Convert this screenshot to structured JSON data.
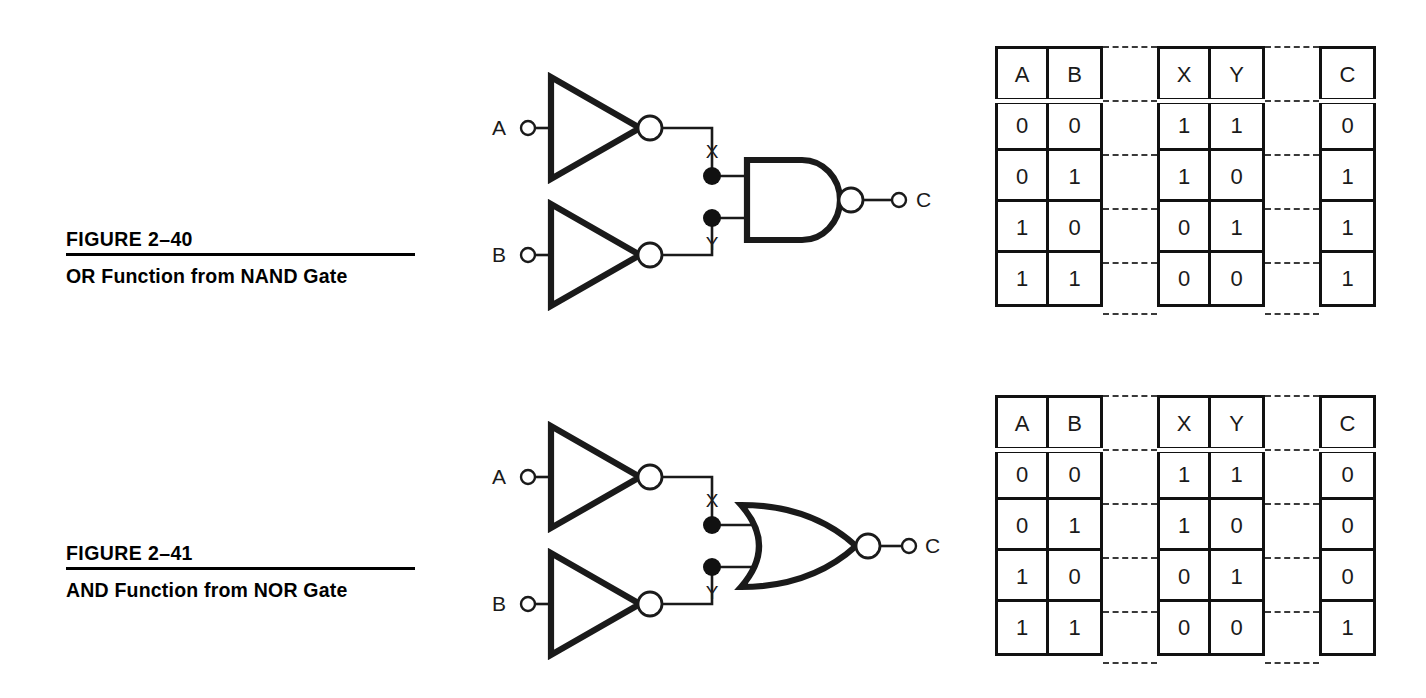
{
  "page": {
    "figures": [
      {
        "id": "figure-2-40",
        "caption_number": "FIGURE 2–40",
        "caption_title": "OR Function from NAND Gate",
        "circuit": {
          "input_labels": [
            "A",
            "B"
          ],
          "node_labels": [
            "X",
            "Y"
          ],
          "output_label": "C",
          "inverter_count": 2,
          "output_gate": "NAND",
          "gate_icon": "nand-gate-icon",
          "inverter_icon": "inverter-gate-icon",
          "bubble_icon": "inversion-bubble-icon",
          "junction_icon": "wire-junction-dot-icon",
          "terminal_icon": "pin-terminal-icon"
        },
        "table": {
          "groups": [
            {
              "name": "inputs",
              "headers": [
                "A",
                "B"
              ],
              "rows": [
                [
                  "0",
                  "0"
                ],
                [
                  "0",
                  "1"
                ],
                [
                  "1",
                  "0"
                ],
                [
                  "1",
                  "1"
                ]
              ]
            },
            {
              "name": "intermediates",
              "headers": [
                "X",
                "Y"
              ],
              "rows": [
                [
                  "1",
                  "1"
                ],
                [
                  "1",
                  "0"
                ],
                [
                  "0",
                  "1"
                ],
                [
                  "0",
                  "0"
                ]
              ]
            },
            {
              "name": "output",
              "headers": [
                "C"
              ],
              "rows": [
                [
                  "0"
                ],
                [
                  "1"
                ],
                [
                  "1"
                ],
                [
                  "1"
                ]
              ]
            }
          ]
        }
      },
      {
        "id": "figure-2-41",
        "caption_number": "FIGURE 2–41",
        "caption_title": "AND Function from NOR Gate",
        "circuit": {
          "input_labels": [
            "A",
            "B"
          ],
          "node_labels": [
            "X",
            "Y"
          ],
          "output_label": "C",
          "inverter_count": 2,
          "output_gate": "NOR",
          "gate_icon": "nor-gate-icon",
          "inverter_icon": "inverter-gate-icon",
          "bubble_icon": "inversion-bubble-icon",
          "junction_icon": "wire-junction-dot-icon",
          "terminal_icon": "pin-terminal-icon"
        },
        "table": {
          "groups": [
            {
              "name": "inputs",
              "headers": [
                "A",
                "B"
              ],
              "rows": [
                [
                  "0",
                  "0"
                ],
                [
                  "0",
                  "1"
                ],
                [
                  "1",
                  "0"
                ],
                [
                  "1",
                  "1"
                ]
              ]
            },
            {
              "name": "intermediates",
              "headers": [
                "X",
                "Y"
              ],
              "rows": [
                [
                  "1",
                  "1"
                ],
                [
                  "1",
                  "0"
                ],
                [
                  "0",
                  "1"
                ],
                [
                  "0",
                  "0"
                ]
              ]
            },
            {
              "name": "output",
              "headers": [
                "C"
              ],
              "rows": [
                [
                  "0"
                ],
                [
                  "0"
                ],
                [
                  "0"
                ],
                [
                  "1"
                ]
              ]
            }
          ]
        }
      }
    ],
    "colors": {
      "ink": "#111111",
      "wire": "#1a1a1a",
      "background": "#ffffff"
    }
  }
}
